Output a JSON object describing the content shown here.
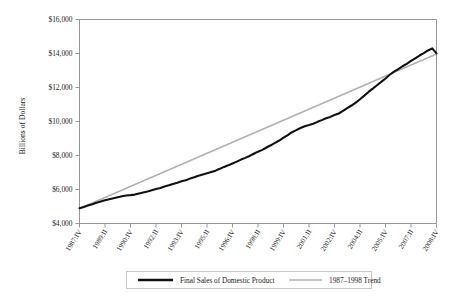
{
  "chart_data": {
    "type": "line",
    "title": "",
    "xlabel": "",
    "ylabel": "Billions of Dollars",
    "ylim": [
      4000,
      16000
    ],
    "yticks": [
      4000,
      6000,
      8000,
      10000,
      12000,
      14000,
      16000
    ],
    "ytick_labels": [
      "$4,000",
      "$6,000",
      "$8,000",
      "$10,000",
      "$12,000",
      "$14,000",
      "$16,000"
    ],
    "grid": false,
    "legend_position": "below-axes",
    "x_unit": "quarter",
    "x_start": "1987:IV",
    "x_end": "2008:IV",
    "xtick_labels": [
      "1987:IV",
      "1989:II",
      "1990:IV",
      "1992:II",
      "1993:IV",
      "1995:II",
      "1996:IV",
      "1998:II",
      "1999:IV",
      "2001:II",
      "2002:IV",
      "2004:II",
      "2005:IV",
      "2007:II",
      "2008:IV"
    ],
    "xtick_interval_quarters": 6,
    "x_quarters": [
      "1987:IV",
      "1988:I",
      "1988:II",
      "1988:III",
      "1988:IV",
      "1989:I",
      "1989:II",
      "1989:III",
      "1989:IV",
      "1990:I",
      "1990:II",
      "1990:III",
      "1990:IV",
      "1991:I",
      "1991:II",
      "1991:III",
      "1991:IV",
      "1992:I",
      "1992:II",
      "1992:III",
      "1992:IV",
      "1993:I",
      "1993:II",
      "1993:III",
      "1993:IV",
      "1994:I",
      "1994:II",
      "1994:III",
      "1994:IV",
      "1995:I",
      "1995:II",
      "1995:III",
      "1995:IV",
      "1996:I",
      "1996:II",
      "1996:III",
      "1996:IV",
      "1997:I",
      "1997:II",
      "1997:III",
      "1997:IV",
      "1998:I",
      "1998:II",
      "1998:III",
      "1998:IV",
      "1999:I",
      "1999:II",
      "1999:III",
      "1999:IV",
      "2000:I",
      "2000:II",
      "2000:III",
      "2000:IV",
      "2001:I",
      "2001:II",
      "2001:III",
      "2001:IV",
      "2002:I",
      "2002:II",
      "2002:III",
      "2002:IV",
      "2003:I",
      "2003:II",
      "2003:III",
      "2003:IV",
      "2004:I",
      "2004:II",
      "2004:III",
      "2004:IV",
      "2005:I",
      "2005:II",
      "2005:III",
      "2005:IV",
      "2006:I",
      "2006:II",
      "2006:III",
      "2006:IV",
      "2007:I",
      "2007:II",
      "2007:III",
      "2007:IV",
      "2008:I",
      "2008:II",
      "2008:III",
      "2008:IV"
    ],
    "series": [
      {
        "name": "Final Sales of Domestic Product",
        "color": "#111111",
        "values": [
          4900,
          4975,
          5060,
          5135,
          5225,
          5300,
          5370,
          5430,
          5490,
          5545,
          5600,
          5650,
          5670,
          5700,
          5760,
          5820,
          5880,
          5950,
          6025,
          6090,
          6180,
          6250,
          6330,
          6400,
          6480,
          6545,
          6640,
          6720,
          6810,
          6880,
          6950,
          7030,
          7110,
          7215,
          7330,
          7420,
          7530,
          7640,
          7760,
          7860,
          7970,
          8100,
          8225,
          8330,
          8470,
          8600,
          8740,
          8880,
          9050,
          9200,
          9370,
          9490,
          9620,
          9720,
          9790,
          9870,
          9980,
          10080,
          10190,
          10270,
          10380,
          10470,
          10620,
          10790,
          10940,
          11110,
          11310,
          11520,
          11740,
          11930,
          12130,
          12330,
          12530,
          12750,
          12930,
          13080,
          13250,
          13390,
          13560,
          13720,
          13880,
          14020,
          14180,
          14300,
          14010
        ]
      },
      {
        "name": "1987–1998 Trend",
        "color": "#b0b0b0",
        "fit_period": "1987:IV–1998:IV",
        "values_endpoints": [
          4880,
          13970
        ]
      }
    ],
    "legend": [
      {
        "label": "Final Sales of Domestic Product",
        "color": "#111111",
        "style": "thick-solid"
      },
      {
        "label": "1987–1998 Trend",
        "color": "#b0b0b0",
        "style": "thin-solid"
      }
    ]
  }
}
